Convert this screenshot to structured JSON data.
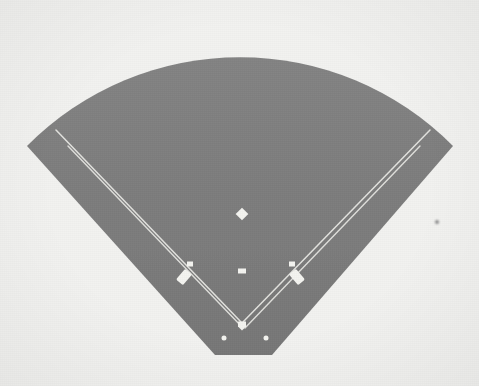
{
  "image": {
    "title": "Baseball field overhead diagram",
    "width": 479,
    "height": 386,
    "rendering": "grayscale halftone scan"
  },
  "palette": {
    "background": "#f2f2f0",
    "field_fill": "#7d7d7d",
    "field_fill_light": "#858585",
    "field_edge_shadow": "#6f6f6f",
    "line_white": "#e8e8e4",
    "marker_white": "#f4f4f0",
    "speck_dark": "#8a8a8a"
  },
  "field": {
    "label": "playing-surface",
    "shape": "fan / sector with flat backstop edge",
    "outfield_arc": {
      "label": "outfield fence arc",
      "apex_y": 42,
      "left_corner": {
        "x": 27,
        "y": 146
      },
      "right_corner": {
        "x": 453,
        "y": 146
      }
    },
    "backstop_edge": {
      "label": "flat backstop edge",
      "left": {
        "x": 215,
        "y": 355
      },
      "right": {
        "x": 272,
        "y": 355
      }
    }
  },
  "markers": [
    {
      "name": "second-base",
      "label": "Second base",
      "shape": "diamond",
      "x": 242,
      "y": 214,
      "w": 9,
      "h": 9,
      "rotation": 45
    },
    {
      "name": "pitchers-rubber",
      "label": "Pitcher's rubber",
      "shape": "rect",
      "x": 242,
      "y": 271,
      "w": 8,
      "h": 5,
      "rotation": 0
    },
    {
      "name": "third-base",
      "label": "Third base",
      "shape": "square",
      "x": 190,
      "y": 264,
      "w": 6,
      "h": 5,
      "rotation": 0
    },
    {
      "name": "first-base",
      "label": "First base",
      "shape": "square",
      "x": 292,
      "y": 264,
      "w": 6,
      "h": 5,
      "rotation": 0
    },
    {
      "name": "third-base-coachs-box",
      "label": "Third base coach's box",
      "shape": "rect",
      "x": 184,
      "y": 277,
      "w": 9,
      "h": 14,
      "rotation": 40
    },
    {
      "name": "first-base-coachs-box",
      "label": "First base coach's box",
      "shape": "rect",
      "x": 297,
      "y": 277,
      "w": 9,
      "h": 14,
      "rotation": -40
    },
    {
      "name": "home-plate",
      "label": "Home plate",
      "shape": "pentagon",
      "x": 242,
      "y": 325,
      "w": 8,
      "h": 7,
      "rotation": 0
    },
    {
      "name": "on-deck-circle-left",
      "label": "Left on-deck circle",
      "shape": "circle",
      "x": 224,
      "y": 338,
      "w": 5,
      "h": 5,
      "rotation": 0
    },
    {
      "name": "on-deck-circle-right",
      "label": "Right on-deck circle",
      "shape": "circle",
      "x": 266,
      "y": 338,
      "w": 5,
      "h": 5,
      "rotation": 0
    }
  ],
  "lines": {
    "left_foul_line": {
      "label": "Left field foul line",
      "from": {
        "x": 241,
        "y": 322
      },
      "to": {
        "x": 56,
        "y": 130
      }
    },
    "right_foul_line": {
      "label": "Right field foul line",
      "from": {
        "x": 243,
        "y": 322
      },
      "to": {
        "x": 430,
        "y": 130
      }
    },
    "third_base_line": {
      "label": "Home to third baseline",
      "from": {
        "x": 243,
        "y": 328
      },
      "to": {
        "x": 68,
        "y": 146
      }
    },
    "first_base_line": {
      "label": "Home to first baseline",
      "from": {
        "x": 245,
        "y": 328
      },
      "to": {
        "x": 420,
        "y": 146
      }
    }
  },
  "artifacts": [
    {
      "name": "scan-speck",
      "label": "Scan speck",
      "x": 437,
      "y": 222,
      "r": 2
    }
  ]
}
